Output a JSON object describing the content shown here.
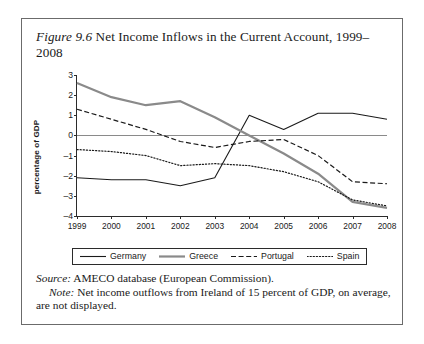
{
  "figure": {
    "label": "Figure 9.6",
    "caption": "Net Income Inflows in the Current Account, 1999–2008"
  },
  "notes": {
    "source_label": "Source:",
    "source_text": "AMECO database (European Commission).",
    "note_label": "Note:",
    "note_text": "Net income outflows from Ireland of 15 percent of GDP, on average, are not displayed."
  },
  "chart_data": {
    "type": "line",
    "title": "Net Income Inflows in the Current Account, 1999–2008",
    "xlabel": "",
    "ylabel": "percentage of GDP",
    "categories": [
      1999,
      2000,
      2001,
      2002,
      2003,
      2004,
      2005,
      2006,
      2007,
      2008
    ],
    "xtick_labels": [
      "1999",
      "2000",
      "2001",
      "2002",
      "2003",
      "2004",
      "2005",
      "2006",
      "2007",
      "2008"
    ],
    "ytick_labels": [
      "3",
      "2",
      "1",
      "0",
      "–1",
      "–2",
      "–3",
      "–4"
    ],
    "ytick_values": [
      3,
      2,
      1,
      0,
      -1,
      -2,
      -3,
      -4
    ],
    "ylim": [
      -4,
      3
    ],
    "xlim": [
      1999,
      2008
    ],
    "grid": false,
    "zero_line": true,
    "legend_position": "below-plot",
    "series": [
      {
        "name": "Germany",
        "style": "solid",
        "color": "#1a1a1a",
        "width": 1.1,
        "values": [
          -2.1,
          -2.2,
          -2.2,
          -2.5,
          -2.1,
          1.0,
          0.3,
          1.1,
          1.1,
          0.8
        ]
      },
      {
        "name": "Greece",
        "style": "solid",
        "color": "#8a8a8a",
        "width": 2.2,
        "values": [
          2.6,
          1.9,
          1.5,
          1.7,
          0.9,
          0.0,
          -0.9,
          -1.9,
          -3.3,
          -3.6
        ]
      },
      {
        "name": "Portugal",
        "style": "dashed",
        "color": "#1a1a1a",
        "width": 1.2,
        "values": [
          1.3,
          0.8,
          0.3,
          -0.3,
          -0.6,
          -0.3,
          -0.2,
          -1.0,
          -2.3,
          -2.4
        ]
      },
      {
        "name": "Spain",
        "style": "dotted",
        "color": "#1a1a1a",
        "width": 1.2,
        "values": [
          -0.7,
          -0.8,
          -1.0,
          -1.5,
          -1.4,
          -1.5,
          -1.8,
          -2.3,
          -3.2,
          -3.5
        ]
      }
    ]
  }
}
